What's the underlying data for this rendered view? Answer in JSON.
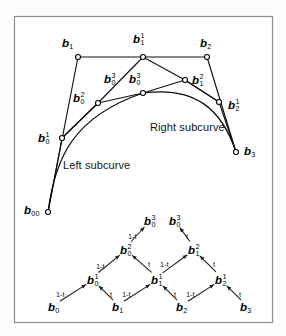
{
  "figure": {
    "frame": {
      "x": 14,
      "y": 16,
      "width": 258,
      "height": 306,
      "border_color": "#8d8d8d",
      "background": "#ffffff"
    },
    "line_color": "#111111",
    "curve_color": "#0a0a0a",
    "marker_fill": "#ffffff"
  },
  "top_diagram": {
    "captions": [
      {
        "id": "left-subcurve",
        "text": "Left subcurve",
        "x": 63,
        "y": 160
      },
      {
        "id": "right-subcurve",
        "text": "Right subcurve",
        "x": 150,
        "y": 122
      }
    ],
    "points": [
      {
        "id": "b00",
        "base": "b",
        "sub": "0",
        "sup": "",
        "sub2": "0",
        "x": 48,
        "y": 212,
        "label_x": 24,
        "label_y": 205
      },
      {
        "id": "b1",
        "base": "b",
        "sub": "1",
        "sup": "",
        "x": 78,
        "y": 57,
        "label_x": 62,
        "label_y": 38
      },
      {
        "id": "b11",
        "base": "b",
        "sub": "1",
        "sup": "1",
        "x": 143,
        "y": 57,
        "label_x": 133,
        "label_y": 33
      },
      {
        "id": "b2",
        "base": "b",
        "sub": "2",
        "sup": "",
        "x": 207,
        "y": 57,
        "label_x": 200,
        "label_y": 38
      },
      {
        "id": "b01",
        "base": "b",
        "sub": "0",
        "sup": "1",
        "x": 62,
        "y": 138,
        "label_x": 38,
        "label_y": 132
      },
      {
        "id": "b02",
        "base": "b",
        "sub": "0",
        "sup": "2",
        "x": 98,
        "y": 103,
        "label_x": 73,
        "label_y": 92
      },
      {
        "id": "b03l",
        "base": "b",
        "sub": "0",
        "sup": "3",
        "x": 143,
        "y": 93,
        "label_x": 104,
        "label_y": 73
      },
      {
        "id": "b03r",
        "base": "b",
        "sub": "0",
        "sup": "3",
        "x": 143,
        "y": 93,
        "label_x": 129,
        "label_y": 73
      },
      {
        "id": "b12",
        "base": "b",
        "sub": "1",
        "sup": "2",
        "x": 185,
        "y": 80,
        "label_x": 192,
        "label_y": 74
      },
      {
        "id": "b21",
        "base": "b",
        "sub": "2",
        "sup": "1",
        "x": 219,
        "y": 102,
        "label_x": 228,
        "label_y": 99
      },
      {
        "id": "b3",
        "base": "b",
        "sub": "3",
        "sup": "",
        "x": 236,
        "y": 152,
        "label_x": 244,
        "label_y": 146
      }
    ],
    "control_polygon": "48,212 78,57 143,57 207,57 236,152",
    "inner_polyline_left": "48,212 62,138 98,103 143,93",
    "inner_polyline_right": "143,93 185,80 219,102 236,152",
    "hull_chords": "62,138 98,103 143,57 185,80 219,102",
    "left_subcurve_path": "M48,212 C55,158 73,117 143,93",
    "right_subcurve_path": "M143,93 C196,86 222,110 236,152"
  },
  "tree_diagram": {
    "edge_labels": {
      "left": "1-t",
      "right": "t"
    },
    "nodes": [
      {
        "id": "t-b0",
        "base": "b",
        "sub": "0",
        "sup": "",
        "x": 54,
        "y": 309,
        "level": 0
      },
      {
        "id": "t-b1",
        "base": "b",
        "sub": "1",
        "sup": "",
        "x": 118,
        "y": 309,
        "level": 0
      },
      {
        "id": "t-b2",
        "base": "b",
        "sub": "2",
        "sup": "",
        "x": 182,
        "y": 309,
        "level": 0
      },
      {
        "id": "t-b3",
        "base": "b",
        "sub": "3",
        "sup": "",
        "x": 246,
        "y": 309,
        "level": 0
      },
      {
        "id": "t-b01",
        "base": "b",
        "sub": "0",
        "sup": "1",
        "x": 93,
        "y": 281,
        "level": 1
      },
      {
        "id": "t-b11",
        "base": "b",
        "sub": "1",
        "sup": "1",
        "x": 157,
        "y": 281,
        "level": 1
      },
      {
        "id": "t-b21",
        "base": "b",
        "sub": "2",
        "sup": "1",
        "x": 221,
        "y": 281,
        "level": 1
      },
      {
        "id": "t-b02",
        "base": "b",
        "sub": "0",
        "sup": "2",
        "x": 126,
        "y": 251,
        "level": 2
      },
      {
        "id": "t-b12",
        "base": "b",
        "sub": "1",
        "sup": "2",
        "x": 194,
        "y": 251,
        "level": 2
      },
      {
        "id": "t-b03a",
        "base": "b",
        "sub": "0",
        "sup": "3",
        "x": 150,
        "y": 222,
        "level": 3
      },
      {
        "id": "t-b03b",
        "base": "b",
        "sub": "0",
        "sup": "3",
        "x": 175,
        "y": 222,
        "level": 3
      }
    ],
    "edges": [
      {
        "from": "t-b0",
        "to": "t-b01",
        "label": "1-t",
        "lx": 56,
        "ly": 291
      },
      {
        "from": "t-b1",
        "to": "t-b01",
        "label": "t",
        "lx": 110,
        "ly": 291
      },
      {
        "from": "t-b1",
        "to": "t-b11",
        "label": "1-t",
        "lx": 122,
        "ly": 291
      },
      {
        "from": "t-b2",
        "to": "t-b11",
        "label": "t",
        "lx": 174,
        "ly": 291
      },
      {
        "from": "t-b2",
        "to": "t-b21",
        "label": "1-t",
        "lx": 186,
        "ly": 291
      },
      {
        "from": "t-b3",
        "to": "t-b21",
        "label": "t",
        "lx": 239,
        "ly": 291
      },
      {
        "from": "t-b01",
        "to": "t-b02",
        "label": "1-t",
        "lx": 96,
        "ly": 263
      },
      {
        "from": "t-b11",
        "to": "t-b02",
        "label": "t",
        "lx": 148,
        "ly": 261
      },
      {
        "from": "t-b11",
        "to": "t-b12",
        "label": "1-t",
        "lx": 160,
        "ly": 261
      },
      {
        "from": "t-b21",
        "to": "t-b12",
        "label": "t",
        "lx": 213,
        "ly": 261
      },
      {
        "from": "t-b02",
        "to": "t-b03a",
        "label": "1-t",
        "lx": 128,
        "ly": 233
      },
      {
        "from": "t-b12",
        "to": "t-b03b",
        "label": "t",
        "lx": 186,
        "ly": 233
      }
    ]
  }
}
